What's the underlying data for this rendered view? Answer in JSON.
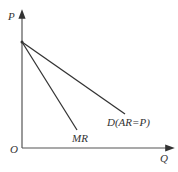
{
  "diagram": {
    "axes": {
      "y_label": "P",
      "x_label": "Q",
      "origin_label": "O"
    },
    "curves": [
      {
        "name": "MR",
        "label": "MR"
      },
      {
        "name": "demand",
        "label": "D(AR=P)"
      }
    ],
    "colors": {
      "line": "#333333",
      "background": "#ffffff"
    }
  }
}
